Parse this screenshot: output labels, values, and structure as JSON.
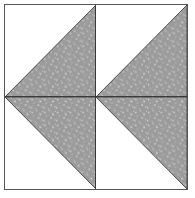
{
  "figure": {
    "width": 195,
    "height": 198,
    "background_color": "#ffffff",
    "frame": {
      "border_color": "#555555",
      "border_width": 1,
      "fill_color": "#ffffff",
      "left": 4,
      "top": 4,
      "width": 184,
      "height": 186
    },
    "dividers": {
      "color": "#3a3a3a",
      "horizontal_label": "center horizontal seam",
      "vertical_label": "center vertical seam"
    },
    "fill": {
      "base_color": "#9b9b9b",
      "speckle_light_color": "#d8d8d8",
      "speckle_mid_color": "#bdbdbd",
      "edge_color": "#3a3a3a",
      "empty_color": "#ffffff",
      "pattern_name": "gray-stipple"
    },
    "units": [
      {
        "id": "unit-top-left",
        "name": "top-left-half-square-triangle",
        "row": 1,
        "column": 1,
        "triangle_orientation": "lower-left",
        "hypotenuse": "top-right-to-bottom-left",
        "points": "100,0 100,100 0,100",
        "filled": true
      },
      {
        "id": "unit-top-right",
        "name": "top-right-half-square-triangle",
        "row": 1,
        "column": 2,
        "triangle_orientation": "lower-left",
        "hypotenuse": "top-right-to-bottom-left",
        "points": "100,0 100,100 0,100",
        "filled": true
      },
      {
        "id": "unit-bottom-left",
        "name": "bottom-left-half-square-triangle",
        "row": 2,
        "column": 1,
        "triangle_orientation": "upper-left",
        "hypotenuse": "bottom-right-to-top-left",
        "points": "100,0 100,100 0,0",
        "filled": true
      },
      {
        "id": "unit-bottom-right",
        "name": "bottom-right-half-square-triangle",
        "row": 2,
        "column": 2,
        "triangle_orientation": "upper-left",
        "hypotenuse": "bottom-right-to-top-left",
        "points": "100,0 100,100 0,0",
        "filled": true
      }
    ],
    "composite_shapes": [
      {
        "name": "left-chevron",
        "description": "left-pointing arrowhead formed by the two left units",
        "apex": "left edge, vertical center"
      },
      {
        "name": "right-chevron",
        "description": "left-pointing arrowhead formed by the two right units",
        "apex": "horizontal center, vertical center"
      }
    ]
  }
}
